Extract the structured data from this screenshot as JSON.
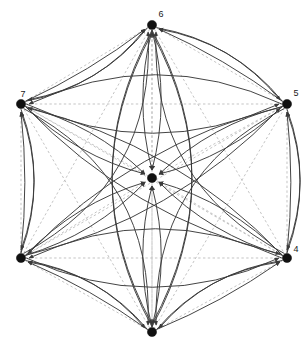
{
  "diagram": {
    "width": 304,
    "height": 351,
    "background": "#ffffff",
    "colors": {
      "node_fill": "#111111",
      "solid_edge": "#3a3a3a",
      "dashed_edge": "#b9b9b9",
      "label_text": "#1a1a1a",
      "arrowhead": "#3a3a3a"
    },
    "node_radius": 4.6,
    "nodes": [
      {
        "id": "n6",
        "label": "6",
        "x": 152,
        "y": 25,
        "label_dx": 9,
        "label_dy": -8,
        "labeled": true
      },
      {
        "id": "n5",
        "label": "5",
        "x": 287,
        "y": 104,
        "label_dx": 9,
        "label_dy": -8,
        "labeled": true
      },
      {
        "id": "n4",
        "label": "4",
        "x": 287,
        "y": 258,
        "label_dx": 9,
        "label_dy": -6,
        "labeled": true
      },
      {
        "id": "n3",
        "label": "",
        "x": 152,
        "y": 332,
        "label_dx": 0,
        "label_dy": 0,
        "labeled": false
      },
      {
        "id": "n2",
        "label": "",
        "x": 21,
        "y": 258,
        "label_dx": 9,
        "label_dy": -6,
        "labeled": false
      },
      {
        "id": "n7",
        "label": "7",
        "x": 21,
        "y": 104,
        "label_dx": 2,
        "label_dy": -7,
        "labeled": true
      },
      {
        "id": "nc",
        "label": "",
        "x": 152,
        "y": 178,
        "label_dx": 0,
        "label_dy": -7,
        "labeled": false
      }
    ],
    "dashed_edges": [
      {
        "from": "n6",
        "to": "n5"
      },
      {
        "from": "n6",
        "to": "n4"
      },
      {
        "from": "n6",
        "to": "n3"
      },
      {
        "from": "n6",
        "to": "n2"
      },
      {
        "from": "n6",
        "to": "n7"
      },
      {
        "from": "n6",
        "to": "nc"
      },
      {
        "from": "n5",
        "to": "n4"
      },
      {
        "from": "n5",
        "to": "n3"
      },
      {
        "from": "n5",
        "to": "n2"
      },
      {
        "from": "n5",
        "to": "n7"
      },
      {
        "from": "n5",
        "to": "nc"
      },
      {
        "from": "n4",
        "to": "n3"
      },
      {
        "from": "n4",
        "to": "n2"
      },
      {
        "from": "n4",
        "to": "n7"
      },
      {
        "from": "n4",
        "to": "nc"
      },
      {
        "from": "n3",
        "to": "n2"
      },
      {
        "from": "n3",
        "to": "n7"
      },
      {
        "from": "n3",
        "to": "nc"
      },
      {
        "from": "n2",
        "to": "n7"
      },
      {
        "from": "n2",
        "to": "nc"
      },
      {
        "from": "n7",
        "to": "nc"
      }
    ],
    "directed_edges": [
      {
        "from": "n7",
        "to": "n6",
        "bow": 0.17
      },
      {
        "from": "n6",
        "to": "n7",
        "bow": -0.17
      },
      {
        "from": "n5",
        "to": "n6",
        "bow": 0.17
      },
      {
        "from": "n6",
        "to": "n5",
        "bow": -0.17
      },
      {
        "from": "n2",
        "to": "n7",
        "bow": 0.17
      },
      {
        "from": "n7",
        "to": "n2",
        "bow": -0.17
      },
      {
        "from": "n4",
        "to": "n5",
        "bow": 0.17
      },
      {
        "from": "n5",
        "to": "n4",
        "bow": -0.17
      },
      {
        "from": "n3",
        "to": "n2",
        "bow": 0.17
      },
      {
        "from": "n2",
        "to": "n3",
        "bow": -0.17
      },
      {
        "from": "n3",
        "to": "n4",
        "bow": -0.17
      },
      {
        "from": "n4",
        "to": "n3",
        "bow": 0.17
      },
      {
        "from": "n7",
        "to": "n5",
        "bow": 0.22
      },
      {
        "from": "n5",
        "to": "n7",
        "bow": 0.22
      },
      {
        "from": "n2",
        "to": "n4",
        "bow": 0.22
      },
      {
        "from": "n4",
        "to": "n2",
        "bow": 0.22
      },
      {
        "from": "n6",
        "to": "n3",
        "bow": 0.26
      },
      {
        "from": "n3",
        "to": "n6",
        "bow": 0.26
      },
      {
        "from": "n6",
        "to": "n3",
        "bow": -0.26
      },
      {
        "from": "n3",
        "to": "n6",
        "bow": -0.26
      },
      {
        "from": "n7",
        "to": "n4",
        "bow": 0.14
      },
      {
        "from": "n4",
        "to": "n7",
        "bow": 0.14
      },
      {
        "from": "n2",
        "to": "n5",
        "bow": 0.14
      },
      {
        "from": "n5",
        "to": "n2",
        "bow": 0.14
      },
      {
        "from": "n7",
        "to": "nc",
        "bow": 0.12
      },
      {
        "from": "n5",
        "to": "nc",
        "bow": 0.12
      },
      {
        "from": "n2",
        "to": "nc",
        "bow": 0.12
      },
      {
        "from": "n4",
        "to": "nc",
        "bow": 0.12
      },
      {
        "from": "n6",
        "to": "nc",
        "bow": 0.12
      },
      {
        "from": "n3",
        "to": "nc",
        "bow": 0.12
      },
      {
        "from": "n7",
        "to": "nc",
        "bow": -0.12
      },
      {
        "from": "n5",
        "to": "nc",
        "bow": -0.12
      },
      {
        "from": "n2",
        "to": "nc",
        "bow": -0.12
      },
      {
        "from": "n4",
        "to": "nc",
        "bow": -0.12
      },
      {
        "from": "n6",
        "to": "nc",
        "bow": -0.12
      },
      {
        "from": "n3",
        "to": "nc",
        "bow": -0.12
      },
      {
        "from": "n7",
        "to": "n6",
        "bow": 0.05
      },
      {
        "from": "n5",
        "to": "n6",
        "bow": 0.05
      },
      {
        "from": "n2",
        "to": "n7",
        "bow": 0.05
      },
      {
        "from": "n4",
        "to": "n5",
        "bow": 0.05
      },
      {
        "from": "n3",
        "to": "n2",
        "bow": 0.05
      },
      {
        "from": "n3",
        "to": "n4",
        "bow": 0.05
      },
      {
        "from": "n2",
        "to": "n6",
        "bow": 0.3
      },
      {
        "from": "n4",
        "to": "n6",
        "bow": -0.3
      },
      {
        "from": "n7",
        "to": "n3",
        "bow": -0.3
      },
      {
        "from": "n5",
        "to": "n3",
        "bow": 0.3
      }
    ]
  }
}
